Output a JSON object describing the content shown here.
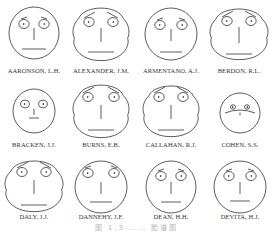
{
  "figure": {
    "caption": "图 1.3  ……  脸谱图",
    "faces": [
      {
        "name": "AARONSON, L.H.",
        "cx": 34,
        "cy": 33,
        "rx": 25,
        "ry": 26,
        "shape": "round",
        "eye_r": 4.5,
        "eye_dx": 10,
        "eye_dy": -9,
        "brow": "short",
        "nose": 12,
        "mouth_w": 12,
        "mouth_dy": 16,
        "mouth_curve": 0,
        "label_y": 67
      },
      {
        "name": "ALEXANDER, J.M.",
        "cx": 101,
        "cy": 34,
        "rx": 28,
        "ry": 28,
        "shape": "jowl",
        "eye_r": 4.5,
        "eye_dx": 12,
        "eye_dy": -12,
        "brow": "long",
        "nose": 14,
        "mouth_w": 13,
        "mouth_dy": 18,
        "mouth_curve": 0,
        "label_y": 67
      },
      {
        "name": "ARMENTANO, A.J.",
        "cx": 171,
        "cy": 34,
        "rx": 26,
        "ry": 26,
        "shape": "round",
        "eye_r": 4.5,
        "eye_dx": 11,
        "eye_dy": -9,
        "brow": "short",
        "nose": 12,
        "mouth_w": 11,
        "mouth_dy": 18,
        "mouth_curve": 0,
        "label_y": 67
      },
      {
        "name": "BERDON, R.L.",
        "cx": 239,
        "cy": 34,
        "rx": 29,
        "ry": 27,
        "shape": "jowl",
        "eye_r": 4.5,
        "eye_dx": 12,
        "eye_dy": -13,
        "brow": "long",
        "nose": 16,
        "mouth_w": 13,
        "mouth_dy": 20,
        "mouth_curve": 0,
        "label_y": 67
      },
      {
        "name": "BRACKEN, J.J.",
        "cx": 34,
        "cy": 111,
        "rx": 21,
        "ry": 22,
        "shape": "round",
        "eye_r": 3.8,
        "eye_dx": 9,
        "eye_dy": -7,
        "brow": "none",
        "nose": 6,
        "mouth_w": 5,
        "mouth_dy": 7,
        "mouth_curve": 0,
        "label_y": 141
      },
      {
        "name": "BURNS, E.B.",
        "cx": 101,
        "cy": 111,
        "rx": 28,
        "ry": 28,
        "shape": "jowl",
        "eye_r": 4.5,
        "eye_dx": 13,
        "eye_dy": -14,
        "brow": "long",
        "nose": 14,
        "mouth_w": 13,
        "mouth_dy": 19,
        "mouth_curve": 0,
        "label_y": 141
      },
      {
        "name": "CALLAHAN, R.J.",
        "cx": 171,
        "cy": 111,
        "rx": 28,
        "ry": 27,
        "shape": "jowl",
        "eye_r": 4.5,
        "eye_dx": 12,
        "eye_dy": -14,
        "brow": "long",
        "nose": 14,
        "mouth_w": 13,
        "mouth_dy": 19,
        "mouth_curve": 0,
        "label_y": 141
      },
      {
        "name": "COHEN, S.S.",
        "cx": 240,
        "cy": 113,
        "rx": 20,
        "ry": 20,
        "shape": "round",
        "eye_r": 2.2,
        "eye_dx": 7,
        "eye_dy": -6,
        "brow": "none",
        "nose": 3,
        "mouth_w": 15,
        "mouth_dy": 0,
        "mouth_curve": -3,
        "label_y": 141
      },
      {
        "name": "DALY, J.J.",
        "cx": 34,
        "cy": 186,
        "rx": 29,
        "ry": 27,
        "shape": "jowl",
        "eye_r": 4.5,
        "eye_dx": 12,
        "eye_dy": -14,
        "brow": "long",
        "nose": 14,
        "mouth_w": 13,
        "mouth_dy": 19,
        "mouth_curve": 0,
        "label_y": 213
      },
      {
        "name": "DANNEHY, J.F.",
        "cx": 101,
        "cy": 187,
        "rx": 26,
        "ry": 26,
        "shape": "round",
        "eye_r": 4.5,
        "eye_dx": 13,
        "eye_dy": -14,
        "brow": "short",
        "nose": 12,
        "mouth_w": 11,
        "mouth_dy": 15,
        "mouth_curve": 0,
        "label_y": 213
      },
      {
        "name": "DEAN, H.H.",
        "cx": 171,
        "cy": 187,
        "rx": 25,
        "ry": 26,
        "shape": "round",
        "eye_r": 4.5,
        "eye_dx": 10,
        "eye_dy": -11,
        "brow": "short",
        "nose": 12,
        "mouth_w": 10,
        "mouth_dy": 15,
        "mouth_curve": 0,
        "label_y": 213
      },
      {
        "name": "DEVITA, H.J.",
        "cx": 240,
        "cy": 187,
        "rx": 26,
        "ry": 26,
        "shape": "round",
        "eye_r": 4.5,
        "eye_dx": 11,
        "eye_dy": -11,
        "brow": "short",
        "nose": 12,
        "mouth_w": 10,
        "mouth_dy": 14,
        "mouth_curve": 0,
        "label_y": 213
      }
    ]
  }
}
